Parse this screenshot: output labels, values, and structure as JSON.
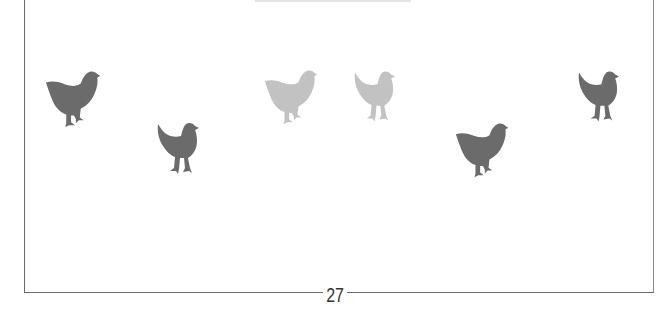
{
  "page": {
    "number": "27"
  },
  "illustration": {
    "hens": [
      {
        "id": "hen-1",
        "x": 44,
        "y": 69,
        "w": 58,
        "h": 62,
        "color": "#6b6b6b",
        "facing": "right",
        "pose": "walking"
      },
      {
        "id": "hen-2",
        "x": 155,
        "y": 122,
        "w": 46,
        "h": 60,
        "color": "#6b6b6b",
        "facing": "right",
        "pose": "standing"
      },
      {
        "id": "hen-3",
        "x": 263,
        "y": 67,
        "w": 56,
        "h": 62,
        "color": "#c2c2c2",
        "facing": "right",
        "pose": "walking"
      },
      {
        "id": "hen-4",
        "x": 352,
        "y": 70,
        "w": 45,
        "h": 60,
        "color": "#c2c2c2",
        "facing": "right",
        "pose": "standing"
      },
      {
        "id": "hen-5",
        "x": 454,
        "y": 120,
        "w": 56,
        "h": 62,
        "color": "#6b6b6b",
        "facing": "right",
        "pose": "walking"
      },
      {
        "id": "hen-6",
        "x": 576,
        "y": 70,
        "w": 45,
        "h": 60,
        "color": "#6b6b6b",
        "facing": "right",
        "pose": "standing"
      }
    ]
  }
}
